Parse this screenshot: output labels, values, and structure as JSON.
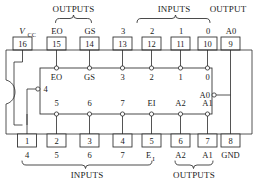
{
  "diagram": {
    "package": "16-pin DIP with left-edge notch"
  },
  "group_labels": {
    "top_outputs": "OUTPUTS",
    "top_inputs": "INPUTS",
    "top_output": "OUTPUT",
    "bottom_inputs": "INPUTS",
    "bottom_outputs": "OUTPUTS"
  },
  "top_pins": [
    {
      "number": "16",
      "outer_label": "V",
      "outer_sub": "CC",
      "inner_label": "",
      "kind": "power"
    },
    {
      "number": "15",
      "outer_label": "EO",
      "outer_sub": "",
      "inner_label": "EO",
      "kind": "output"
    },
    {
      "number": "14",
      "outer_label": "GS",
      "outer_sub": "",
      "inner_label": "GS",
      "kind": "output"
    },
    {
      "number": "13",
      "outer_label": "3",
      "outer_sub": "",
      "inner_label": "3",
      "kind": "input"
    },
    {
      "number": "12",
      "outer_label": "2",
      "outer_sub": "",
      "inner_label": "2",
      "kind": "input"
    },
    {
      "number": "11",
      "outer_label": "1",
      "outer_sub": "",
      "inner_label": "1",
      "kind": "input"
    },
    {
      "number": "10",
      "outer_label": "0",
      "outer_sub": "",
      "inner_label": "0",
      "kind": "input"
    },
    {
      "number": "9",
      "outer_label": "A0",
      "outer_sub": "",
      "inner_label": "A0",
      "kind": "output"
    }
  ],
  "bottom_pins": [
    {
      "number": "1",
      "outer_label": "4",
      "outer_sub": "",
      "inner_label": "4",
      "kind": "input"
    },
    {
      "number": "2",
      "outer_label": "5",
      "outer_sub": "",
      "inner_label": "5",
      "kind": "input"
    },
    {
      "number": "3",
      "outer_label": "6",
      "outer_sub": "",
      "inner_label": "6",
      "kind": "input"
    },
    {
      "number": "4",
      "outer_label": "7",
      "outer_sub": "",
      "inner_label": "7",
      "kind": "input"
    },
    {
      "number": "5",
      "outer_label": "E",
      "outer_sub": "I",
      "inner_label": "EI",
      "kind": "input"
    },
    {
      "number": "6",
      "outer_label": "A2",
      "outer_sub": "",
      "inner_label": "A2",
      "kind": "output"
    },
    {
      "number": "7",
      "outer_label": "A1",
      "outer_sub": "",
      "inner_label": "A1",
      "kind": "output"
    },
    {
      "number": "8",
      "outer_label": "GND",
      "outer_sub": "",
      "inner_label": "",
      "kind": "ground"
    }
  ],
  "inner_left_label": "4",
  "inner_right_label": "A0",
  "colors": {
    "ink": "#1a1a1a",
    "line": "#2a2a2a",
    "paper": "#ffffff"
  }
}
